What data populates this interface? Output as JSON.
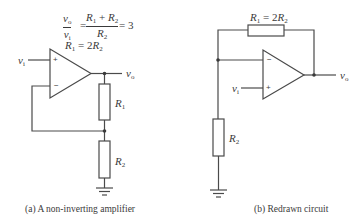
{
  "figure_a": {
    "equation": {
      "lhs_num": "v",
      "lhs_num_sub": "o",
      "lhs_den": "v",
      "lhs_den_sub": "i",
      "equals1": "=",
      "rhs_num_a": "R",
      "rhs_num_a_sub": "1",
      "rhs_num_plus": " + ",
      "rhs_num_b": "R",
      "rhs_num_b_sub": "2",
      "rhs_den": "R",
      "rhs_den_sub": "2",
      "equals2": "= 3"
    },
    "condition": {
      "a": "R",
      "a_sub": "1",
      "eq": " = 2",
      "b": "R",
      "b_sub": "2"
    },
    "input_label": {
      "v": "v",
      "sub": "i"
    },
    "output_label": {
      "v": "v",
      "sub": "o"
    },
    "plus_sign": "+",
    "minus_sign": "−",
    "r1_label": {
      "r": "R",
      "sub": "1"
    },
    "r2_label": {
      "r": "R",
      "sub": "2"
    },
    "caption": "(a) A non-inverting amplifier"
  },
  "figure_b": {
    "r1_label": {
      "a": "R",
      "a_sub": "1",
      "eq": " = 2",
      "b": "R",
      "b_sub": "2"
    },
    "input_label": {
      "v": "v",
      "sub": "i"
    },
    "output_label": {
      "v": "v",
      "sub": "o"
    },
    "plus_sign": "+",
    "minus_sign": "−",
    "r2_label": {
      "r": "R",
      "sub": "2"
    },
    "caption": "(b) Redrawn circuit"
  },
  "colors": {
    "wire": "#4a4a4a",
    "text": "#3a3a3a",
    "background": "#ffffff"
  }
}
